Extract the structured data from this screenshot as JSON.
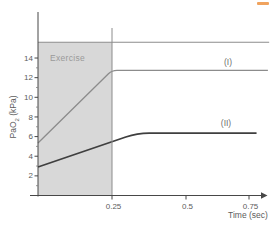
{
  "page": {
    "background": "#ffffff",
    "corner_mark_color": "#f0a35e"
  },
  "chart_data": {
    "type": "line",
    "title": "",
    "xlabel": "Time (sec)",
    "ylabel": "PaO2 (kPa)",
    "ylabel_parts": {
      "pre": "PaO",
      "sub": "2",
      "post": " (kPa)"
    },
    "xlim": [
      0,
      0.83
    ],
    "ylim": [
      0,
      16.2
    ],
    "grid": false,
    "axis_color": "#474747",
    "tick_label_color": "#5c5c5c",
    "x_ticks": [
      {
        "value": 0.25,
        "label": "0.25"
      },
      {
        "value": 0.5,
        "label": "0.5"
      },
      {
        "value": 0.75,
        "label": "0.75"
      }
    ],
    "y_ticks": [
      {
        "value": 2,
        "label": "2"
      },
      {
        "value": 4,
        "label": "4"
      },
      {
        "value": 6,
        "label": "6"
      },
      {
        "value": 8,
        "label": "8"
      },
      {
        "value": 10,
        "label": "10"
      },
      {
        "value": 12,
        "label": "12"
      },
      {
        "value": 14,
        "label": "14"
      }
    ],
    "y_minor_ticks": [
      1,
      3,
      5,
      7,
      9,
      11,
      13
    ],
    "shaded_region": {
      "label": "Exercise",
      "x_start": 0,
      "x_end": 0.25,
      "fill": "#d8d8d8",
      "label_color": "#9a9a9a"
    },
    "marker_line": {
      "x": 0.25,
      "color": "#8c8c8c"
    },
    "series": [
      {
        "name": "reference-top-line",
        "label": "",
        "color": "#8c8c8c",
        "width": 1.1,
        "points": [
          [
            0,
            15.6
          ],
          [
            0.83,
            15.6
          ]
        ]
      },
      {
        "name": "curve-I",
        "label": "(I)",
        "color": "#8c8c8c",
        "width": 1.3,
        "points": [
          [
            0,
            5.35
          ],
          [
            0.25,
            12.75
          ],
          [
            0.825,
            12.75
          ]
        ]
      },
      {
        "name": "curve-II",
        "label": "(II)",
        "color": "#3f3f3f",
        "width": 1.8,
        "points": [
          [
            0,
            2.9
          ],
          [
            0.335,
            6.35
          ],
          [
            0.78,
            6.35
          ]
        ]
      }
    ]
  }
}
